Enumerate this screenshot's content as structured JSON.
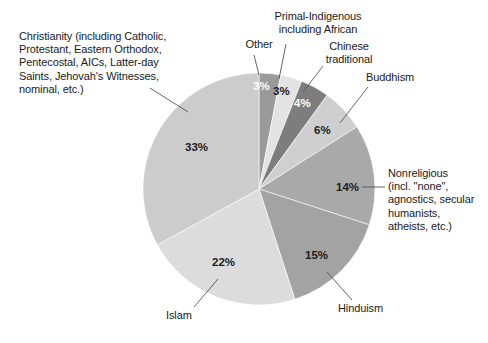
{
  "chart_data": {
    "type": "pie",
    "title": "",
    "subtitle": "",
    "xlabel": "",
    "ylabel": "",
    "legend_position": "callout-labels",
    "grid": false,
    "units": "percent",
    "total": 100,
    "start_angle_deg": 0,
    "direction": "clockwise",
    "categories": [
      "Other",
      "Primal-Indigenous including African",
      "Chinese traditional",
      "Buddhism",
      "Nonreligious (incl. \"none\", agnostics, secular humanists, atheists, etc.)",
      "Hinduism",
      "Islam",
      "Christianity (including Catholic, Protestant, Eastern Orthodox, Pentecostal, AICs, Latter-day Saints, Jehovah's Witnesses, nominal, etc.)"
    ],
    "values": [
      3,
      3,
      4,
      6,
      14,
      15,
      22,
      33
    ],
    "value_labels": [
      "3%",
      "3%",
      "4%",
      "6%",
      "14%",
      "15%",
      "22%",
      "33%"
    ],
    "colors": [
      "#9a9a9a",
      "#e3e3e3",
      "#7d7d7d",
      "#cfcfcf",
      "#a9a9a9",
      "#a3a3a3",
      "#dcdcdc",
      "#cccccc"
    ],
    "slices": [
      {
        "key": "other",
        "label": "Other",
        "value": 3,
        "value_label": "3%",
        "color": "#9a9a9a",
        "label_color": "#ffffff"
      },
      {
        "key": "primal-indigenous",
        "label": "Primal-Indigenous\nincluding African",
        "value": 3,
        "value_label": "3%",
        "color": "#e3e3e3",
        "label_color": "#1c1c1c"
      },
      {
        "key": "chinese-traditional",
        "label": "Chinese\ntraditional",
        "value": 4,
        "value_label": "4%",
        "color": "#7d7d7d",
        "label_color": "#ffffff"
      },
      {
        "key": "buddhism",
        "label": "Buddhism",
        "value": 6,
        "value_label": "6%",
        "color": "#cfcfcf",
        "label_color": "#1c1c1c"
      },
      {
        "key": "nonreligious",
        "label": "Nonreligious\n(incl. \"none\",\nagnostics, secular\nhumanists,\natheists, etc.)",
        "value": 14,
        "value_label": "14%",
        "color": "#a9a9a9",
        "label_color": "#1c1c1c"
      },
      {
        "key": "hinduism",
        "label": "Hinduism",
        "value": 15,
        "value_label": "15%",
        "color": "#a3a3a3",
        "label_color": "#1c1c1c"
      },
      {
        "key": "islam",
        "label": "Islam",
        "value": 22,
        "value_label": "22%",
        "color": "#dcdcdc",
        "label_color": "#1c1c1c"
      },
      {
        "key": "christianity",
        "label": "Christianity (including Catholic,\nProtestant, Eastern Orthodox,\nPentecostal, AICs, Latter-day\nSaints, Jehovah's Witnesses,\nnominal, etc.)",
        "value": 33,
        "value_label": "33%",
        "color": "#cccccc",
        "label_color": "#1c1c1c"
      }
    ]
  },
  "geometry": {
    "center_x": 259,
    "center_y": 189,
    "radius": 116
  },
  "style": {
    "background": "#ffffff",
    "text_color": "#1a1a1a",
    "leader_line_color": "#555555"
  }
}
